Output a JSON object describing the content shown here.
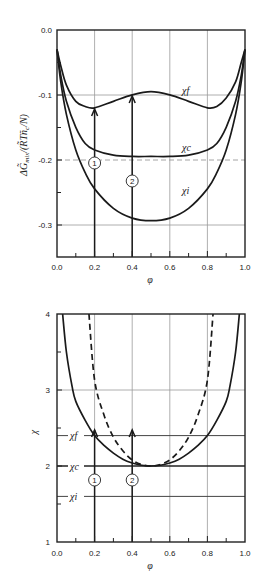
{
  "chart_data": [
    {
      "type": "line",
      "title": "",
      "xlabel": "φ",
      "ylabel": "ΔG̃mix /(R̃T ñc/N)",
      "xlim": [
        0.0,
        1.0
      ],
      "ylim": [
        -0.35,
        0.0
      ],
      "x_ticks": [
        "0.0",
        "0.2",
        "0.4",
        "0.6",
        "0.8",
        "1.0"
      ],
      "y_ticks": [
        "0.0",
        "-0.1",
        "-0.2",
        "-0.3"
      ],
      "grid": true,
      "series": [
        {
          "name": "χf",
          "label": "χ_f",
          "style": "solid",
          "x": [
            0.0,
            0.02,
            0.05,
            0.1,
            0.15,
            0.2,
            0.3,
            0.4,
            0.5,
            0.6,
            0.7,
            0.8,
            0.85,
            0.9,
            0.95,
            0.98,
            1.0
          ],
          "y": [
            -0.03,
            -0.055,
            -0.085,
            -0.11,
            -0.118,
            -0.12,
            -0.11,
            -0.1,
            -0.095,
            -0.1,
            -0.11,
            -0.12,
            -0.118,
            -0.105,
            -0.08,
            -0.05,
            -0.03
          ]
        },
        {
          "name": "χc",
          "label": "χ_c",
          "style": "solid",
          "x": [
            0.0,
            0.02,
            0.05,
            0.1,
            0.15,
            0.2,
            0.3,
            0.4,
            0.5,
            0.6,
            0.7,
            0.8,
            0.85,
            0.9,
            0.95,
            0.98,
            1.0
          ],
          "y": [
            -0.03,
            -0.07,
            -0.11,
            -0.15,
            -0.175,
            -0.185,
            -0.193,
            -0.195,
            -0.195,
            -0.195,
            -0.193,
            -0.185,
            -0.175,
            -0.15,
            -0.11,
            -0.07,
            -0.03
          ]
        },
        {
          "name": "χi",
          "label": "χ_i",
          "style": "solid",
          "x": [
            0.0,
            0.02,
            0.05,
            0.1,
            0.15,
            0.2,
            0.3,
            0.4,
            0.5,
            0.6,
            0.7,
            0.8,
            0.85,
            0.9,
            0.95,
            0.98,
            1.0
          ],
          "y": [
            -0.03,
            -0.08,
            -0.13,
            -0.185,
            -0.22,
            -0.245,
            -0.275,
            -0.29,
            -0.294,
            -0.29,
            -0.275,
            -0.245,
            -0.22,
            -0.185,
            -0.13,
            -0.08,
            -0.03
          ]
        }
      ],
      "annotations": [
        {
          "type": "arrow",
          "x": 0.2,
          "from_y": -0.35,
          "to_y": -0.12,
          "label": "1",
          "label_y": -0.2
        },
        {
          "type": "arrow",
          "x": 0.4,
          "from_y": -0.35,
          "to_y": -0.1,
          "label": "2",
          "label_y": -0.23
        },
        {
          "type": "dashed-hline",
          "y": -0.2
        }
      ]
    },
    {
      "type": "line",
      "title": "",
      "xlabel": "φ",
      "ylabel": "χ",
      "xlim": [
        0.0,
        1.0
      ],
      "ylim": [
        1,
        4
      ],
      "x_ticks": [
        "0.0",
        "0.2",
        "0.4",
        "0.6",
        "0.8",
        "1.0"
      ],
      "y_ticks": [
        "1",
        "2",
        "3",
        "4"
      ],
      "grid": true,
      "levels": [
        {
          "name": "χf",
          "label": "χ_f",
          "y": 2.4
        },
        {
          "name": "χc",
          "label": "χ_c",
          "y": 2.0
        },
        {
          "name": "χi",
          "label": "χ_i",
          "y": 1.6
        }
      ],
      "series": [
        {
          "name": "binodal",
          "style": "solid",
          "x": [
            0.03,
            0.05,
            0.08,
            0.1,
            0.15,
            0.2,
            0.25,
            0.3,
            0.35,
            0.4,
            0.45,
            0.5,
            0.55,
            0.6,
            0.65,
            0.7,
            0.75,
            0.8,
            0.85,
            0.9,
            0.92,
            0.95,
            0.97
          ],
          "y": [
            4.0,
            3.5,
            3.05,
            2.85,
            2.6,
            2.4,
            2.27,
            2.17,
            2.09,
            2.04,
            2.01,
            2.0,
            2.01,
            2.04,
            2.09,
            2.17,
            2.27,
            2.4,
            2.6,
            2.85,
            3.05,
            3.5,
            4.0
          ]
        },
        {
          "name": "spinodal",
          "style": "dashed",
          "x": [
            0.17,
            0.2,
            0.25,
            0.3,
            0.35,
            0.4,
            0.45,
            0.5,
            0.55,
            0.6,
            0.65,
            0.7,
            0.75,
            0.8,
            0.83
          ],
          "y": [
            4.0,
            3.13,
            2.67,
            2.38,
            2.2,
            2.08,
            2.02,
            2.0,
            2.02,
            2.08,
            2.2,
            2.38,
            2.67,
            3.13,
            4.0
          ]
        }
      ],
      "annotations": [
        {
          "type": "arrow",
          "x": 0.2,
          "from_y": 1.0,
          "to_y": 2.4,
          "label": "1",
          "label_y": 1.8
        },
        {
          "type": "arrow",
          "x": 0.4,
          "from_y": 1.0,
          "to_y": 2.4,
          "label": "2",
          "label_y": 1.8
        }
      ]
    }
  ],
  "labels": {
    "top": {
      "ylabel_main": "ΔG̃",
      "ylabel_sub": "mix",
      "ylabel_rest": "/(R̃Tñ",
      "ylabel_c": "c",
      "ylabel_end": "/N)",
      "xlabel": "φ",
      "curve_f": "χf",
      "curve_c": "χc",
      "curve_i": "χi",
      "marker_1": "1",
      "marker_2": "2",
      "y_ticks": [
        "0.0",
        "-0.1",
        "-0.2",
        "-0.3"
      ],
      "x_ticks": [
        "0.0",
        "0.2",
        "0.4",
        "0.6",
        "0.8",
        "1.0"
      ]
    },
    "bottom": {
      "ylabel": "χ",
      "xlabel": "φ",
      "level_f": "χf",
      "level_c": "χc",
      "level_i": "χi",
      "marker_1": "1",
      "marker_2": "2",
      "y_ticks": [
        "4",
        "3",
        "2",
        "1"
      ],
      "x_ticks": [
        "0.0",
        "0.2",
        "0.4",
        "0.6",
        "0.8",
        "1.0"
      ]
    }
  }
}
